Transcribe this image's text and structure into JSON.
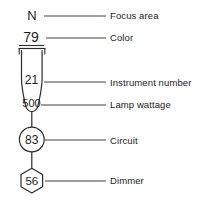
{
  "diagram": {
    "background_color": "#ffffff",
    "line_color": "#2b2b2b",
    "text_color": "#1b1b1b",
    "symbols": {
      "focus_area": {
        "icon_name": "focus-area-letter",
        "value": "N"
      },
      "color": {
        "icon_name": "color-number-underlined",
        "value": "79"
      },
      "instrument": {
        "icon_name": "ellipsoidal-spotlight-plan-symbol",
        "instrument_number": "21",
        "lamp_wattage": "500"
      },
      "circuit": {
        "icon_name": "circuit-circle-symbol",
        "value": "83"
      },
      "dimmer": {
        "icon_name": "dimmer-hexagon-symbol",
        "value": "56"
      }
    },
    "callouts": [
      {
        "key": "focus_area",
        "label": "Focus area"
      },
      {
        "key": "color",
        "label": "Color"
      },
      {
        "key": "instrument",
        "label": "Instrument number"
      },
      {
        "key": "wattage",
        "label": "Lamp wattage"
      },
      {
        "key": "circuit",
        "label": "Circuit"
      },
      {
        "key": "dimmer",
        "label": "Dimmer"
      }
    ]
  }
}
